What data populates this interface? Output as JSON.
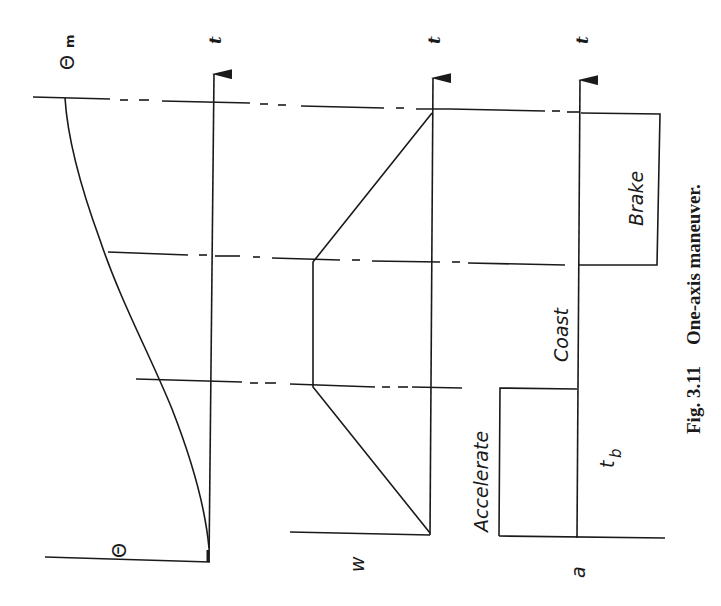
{
  "figure": {
    "caption_number": "Fig. 3.11",
    "caption_text": "One-axis maneuver.",
    "orientation": "rotated 90° counter-clockwise on page"
  },
  "panels": {
    "theta": {
      "axis_label": "Θ",
      "max_label": "Θ",
      "max_subscript": "m",
      "time_label": "t"
    },
    "omega": {
      "axis_label": "w",
      "time_label": "t"
    },
    "accel": {
      "axis_label": "a",
      "time_label": "t",
      "phase_accelerate": "Accelerate",
      "phase_coast": "Coast",
      "phase_brake": "Brake",
      "burn_time_label": "t",
      "burn_time_subscript": "b"
    }
  },
  "style": {
    "ink": "#1a1a1a",
    "background": "#ffffff"
  }
}
